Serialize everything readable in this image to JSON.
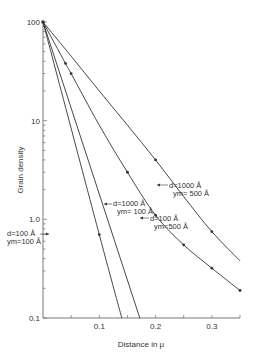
{
  "chart_data": {
    "type": "line",
    "title": "",
    "xlabel": "Distance in μ",
    "ylabel": "Grain density",
    "yscale": "log",
    "xlim": [
      0,
      0.35
    ],
    "ylim": [
      0.1,
      100
    ],
    "x_ticks": [
      0.1,
      0.2,
      0.3
    ],
    "x_tick_labels": [
      "0.1",
      "0.2",
      "0.3"
    ],
    "y_ticks": [
      0.1,
      1.0,
      10,
      100
    ],
    "y_tick_labels": [
      "0.1",
      "1.0",
      "10",
      "100"
    ],
    "grid": false,
    "series": [
      {
        "name": "d=1000 Å, ym=500 Å",
        "label_line1": "d=1000 Å",
        "label_line2": "ym= 500 Å",
        "x": [
          0,
          0.05,
          0.1,
          0.15,
          0.2,
          0.25,
          0.3,
          0.35
        ],
        "y": [
          100,
          45,
          20,
          9,
          4,
          1.7,
          0.75,
          0.38
        ],
        "markers_x": [
          0.2,
          0.3
        ],
        "markers_y": [
          4,
          0.75
        ]
      },
      {
        "name": "d=100 Å, ym=500 Å",
        "label_line1": "d=100 Å",
        "label_line2": "ym=500 Å",
        "x": [
          0,
          0.04,
          0.05,
          0.1,
          0.15,
          0.2,
          0.25,
          0.3,
          0.35
        ],
        "y": [
          100,
          38,
          30,
          9,
          3,
          1.1,
          0.55,
          0.32,
          0.19
        ],
        "markers_x": [
          0.04,
          0.05,
          0.15,
          0.2,
          0.25,
          0.3,
          0.35
        ],
        "markers_y": [
          38,
          30,
          3,
          1.1,
          0.55,
          0.32,
          0.19
        ]
      },
      {
        "name": "d=1000 Å, ym=100 Å",
        "label_line1": "d=1000 Å",
        "label_line2": "ym= 100 Å",
        "x": [
          0,
          0.172
        ],
        "y": [
          100,
          0.1
        ],
        "markers_x": [],
        "markers_y": []
      },
      {
        "name": "d=100 Å, ym=100 Å",
        "label_line1": "d=100 Å",
        "label_line2": "ym=100 Å",
        "x": [
          0,
          0.1,
          0.14
        ],
        "y": [
          100,
          0.7,
          0.1
        ],
        "markers_x": [
          0.1
        ],
        "markers_y": [
          0.7
        ]
      }
    ]
  },
  "colors": {
    "line": "#333333",
    "axis": "#555555",
    "background": "#ffffff"
  }
}
